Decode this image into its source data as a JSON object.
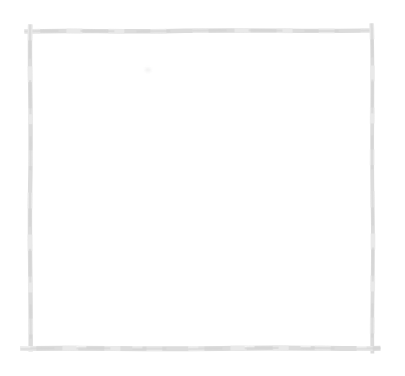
{
  "canvas": {
    "width_px": 405,
    "height_px": 376,
    "background_color": "#ffffff"
  },
  "frame": {
    "style": "hand-drawn-pencil-rectangle",
    "stroke_color": "#dcdcdc",
    "stroke_color_light": "#ebebeb",
    "stroke_color_dark": "#d2d2d2",
    "break_color": "#ffffff"
  },
  "artifacts": {
    "smudge_color": "#f2f2f2"
  }
}
